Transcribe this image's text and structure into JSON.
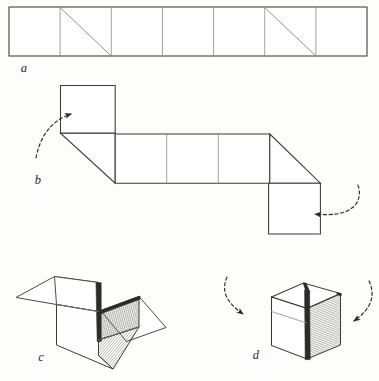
{
  "figure": {
    "background_color": "#fdfdfb",
    "ink_color": "#3a3a38",
    "panels": [
      {
        "key": "a",
        "label": "a",
        "caption": "Flat strip of seven squares with two diagonal creases",
        "label_x": 24,
        "label_y": 72
      },
      {
        "key": "b",
        "label": "b",
        "caption": "Strip partially folded into a zigzag with end squares raised",
        "label_x": 38,
        "label_y": 184
      },
      {
        "key": "c",
        "label": "c",
        "caption": "Open box with flaps spread outward and hatched inner wall",
        "label_x": 41,
        "label_y": 361
      },
      {
        "key": "d",
        "label": "d",
        "caption": "Closed cube with hatched shaded side face",
        "label_x": 256,
        "label_y": 359
      }
    ],
    "strip": {
      "cell_count": 7,
      "left": 9,
      "top": 7,
      "right": 367,
      "bottom": 56,
      "diagonal_cells": [
        2,
        6
      ],
      "diagonal_direction": "top-left-to-bottom-right"
    },
    "zigzag": {
      "top_square": {
        "left": 60,
        "top": 85,
        "right": 115,
        "bottom": 133
      },
      "middle_band": {
        "left": 115,
        "top": 134,
        "right": 270,
        "bottom": 183,
        "cells": 3
      },
      "bottom_square": {
        "left": 268,
        "top": 183,
        "right": 320,
        "bottom": 234
      },
      "dotted_fold": {
        "x1": 61,
        "y1": 133,
        "x2": 115,
        "y2": 133
      }
    },
    "arrows": [
      {
        "name": "fold-up-arrow-left",
        "direction": "right",
        "panel": "b"
      },
      {
        "name": "fold-down-arrow-right",
        "direction": "left",
        "panel": "b"
      },
      {
        "name": "close-arrow-left",
        "direction": "down-right",
        "panel": "d"
      },
      {
        "name": "close-arrow-right",
        "direction": "down-left",
        "panel": "d"
      }
    ],
    "shading": {
      "hatch_color": "#55554f",
      "hatch_spacing_px": 1.6,
      "applied_to": [
        "open-box-inner-wall",
        "open-box-floor",
        "cube-right-face"
      ]
    }
  }
}
